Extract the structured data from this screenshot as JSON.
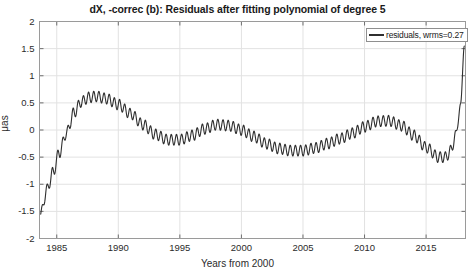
{
  "chart_data": {
    "type": "line",
    "title": "dX, -correc (b): Residuals after fitting polynomial of degree 5",
    "xlabel": "Years from 2000",
    "ylabel": "μas",
    "xlim": [
      1983.6,
      2018.2
    ],
    "ylim": [
      -2,
      2
    ],
    "grid": true,
    "xticks": [
      1985,
      1990,
      1995,
      2000,
      2005,
      2010,
      2015
    ],
    "xtick_labels": [
      "1985",
      "1990",
      "1995",
      "2000",
      "2005",
      "2010",
      "2015"
    ],
    "yticks": [
      -2,
      -1.5,
      -1,
      -0.5,
      0,
      0.5,
      1,
      1.5,
      2
    ],
    "ytick_labels": [
      "-2",
      "-1.5",
      "-1",
      "-0.5",
      "0",
      "0.5",
      "1",
      "1.5",
      "2"
    ],
    "legend_position": "top-right",
    "series": [
      {
        "name": "residuals, wrms=0.27",
        "color": "#2f2f2f",
        "linewidth": 1.1,
        "wrms": 0.27,
        "description": "Residual curve: slow multi-decadal trend with superposed high-frequency oscillation of amplitude about 0.1 microarcsec and period about 0.4 years.",
        "trend_x": [
          1983.7,
          1984.2,
          1984.7,
          1985.2,
          1985.8,
          1986.4,
          1987.0,
          1987.6,
          1988.2,
          1989.0,
          1990.0,
          1991.0,
          1992.0,
          1993.0,
          1994.0,
          1995.0,
          1996.0,
          1997.0,
          1998.0,
          1999.0,
          2000.0,
          2001.0,
          2002.0,
          2003.0,
          2004.0,
          2005.0,
          2006.0,
          2007.0,
          2008.0,
          2009.0,
          2010.0,
          2011.0,
          2012.0,
          2013.0,
          2014.0,
          2015.0,
          2016.0,
          2016.6,
          2017.0,
          2017.4,
          2017.8,
          2018.1
        ],
        "trend_y": [
          -1.55,
          -1.1,
          -0.78,
          -0.42,
          -0.05,
          0.32,
          0.52,
          0.6,
          0.62,
          0.58,
          0.47,
          0.3,
          0.1,
          -0.08,
          -0.18,
          -0.18,
          -0.1,
          0.02,
          0.1,
          0.08,
          0.0,
          -0.12,
          -0.25,
          -0.34,
          -0.38,
          -0.38,
          -0.33,
          -0.25,
          -0.16,
          -0.06,
          0.06,
          0.16,
          0.17,
          0.08,
          -0.1,
          -0.32,
          -0.5,
          -0.5,
          -0.38,
          -0.1,
          0.45,
          1.55
        ],
        "osc_amplitude": 0.1,
        "osc_period_years": 0.42
      }
    ]
  },
  "legend": {
    "entry_label": "residuals, wrms=0.27"
  },
  "axes": {
    "y_axis_label": "μas",
    "x_axis_label": "Years from 2000"
  }
}
